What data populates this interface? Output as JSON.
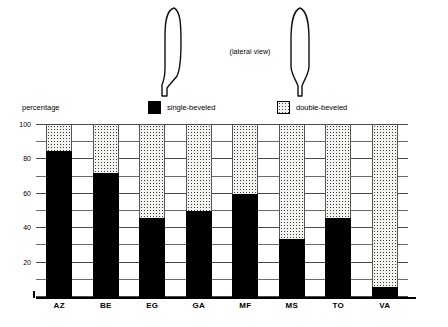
{
  "illustration": {
    "caption": "(lateral view)",
    "left_shape_name": "single-beveled-blade-outline",
    "right_shape_name": "double-beveled-blade-outline"
  },
  "legend": {
    "items": [
      {
        "label": "single-beveled",
        "fill": "black",
        "color": "#000000"
      },
      {
        "label": "double-beveled",
        "fill": "dotted",
        "color": "#f4f4f1"
      }
    ]
  },
  "chart_data": {
    "type": "bar",
    "title": "",
    "subtitle": "",
    "xlabel": "",
    "ylabel": "percentage",
    "ylim": [
      0,
      100
    ],
    "yticks": [
      0,
      20,
      40,
      60,
      80,
      100
    ],
    "ytick_labels": [
      "",
      "20",
      "40",
      "60",
      "80",
      "100"
    ],
    "gridline_interval": 10,
    "grid": true,
    "stacked": true,
    "legend_position": "top",
    "categories": [
      "AZ",
      "BE",
      "EG",
      "GA",
      "MF",
      "MS",
      "TO",
      "VA"
    ],
    "series": [
      {
        "name": "single-beveled",
        "values": [
          85,
          72,
          46,
          50,
          60,
          34,
          46,
          6
        ]
      },
      {
        "name": "double-beveled",
        "values": [
          15,
          28,
          54,
          50,
          40,
          66,
          54,
          94
        ]
      }
    ]
  }
}
